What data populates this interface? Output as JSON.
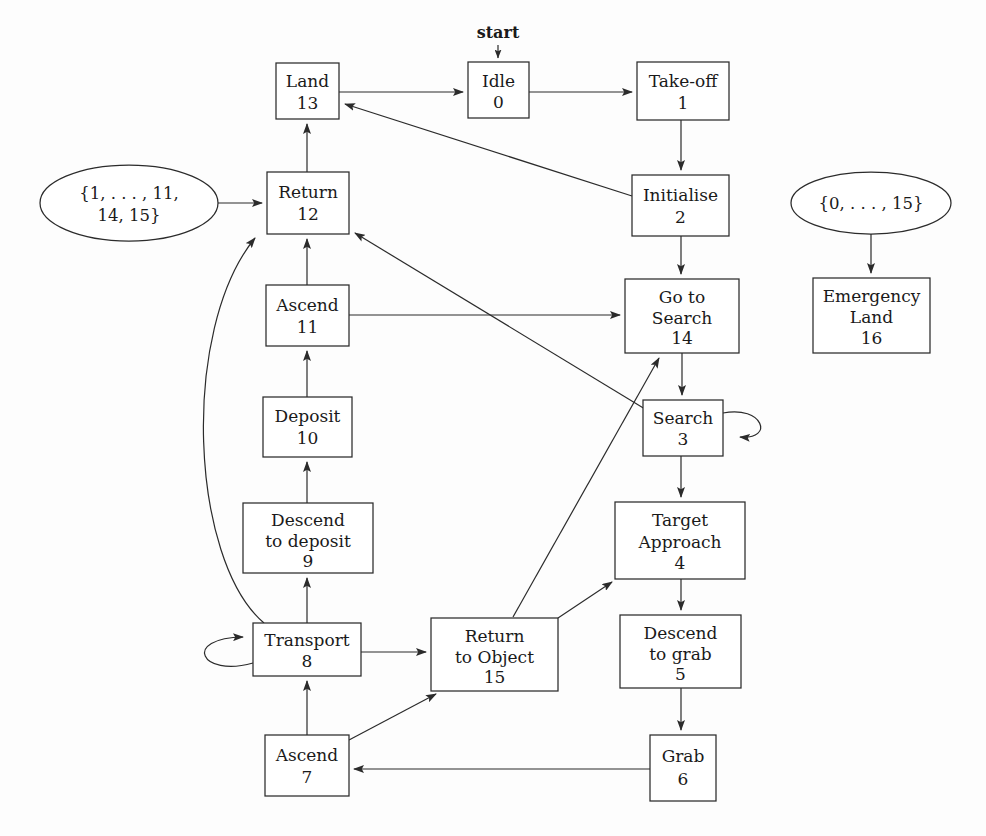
{
  "figure": {
    "type": "state-machine-diagram",
    "title": "",
    "caption": "",
    "start_marker_label": "start",
    "background_color": "#fdfdfd",
    "line_color": "#2b2b2b",
    "text_color": "#1a1a1a"
  },
  "states": [
    {
      "key": "idle",
      "label": "Idle",
      "line1": "Idle",
      "line2": "",
      "id": "0",
      "shape": "rect",
      "x": 468,
      "y": 62,
      "w": 61,
      "h": 56
    },
    {
      "key": "takeoff",
      "label": "Take-off",
      "line1": "Take-off",
      "line2": "",
      "id": "1",
      "shape": "rect",
      "x": 637,
      "y": 62,
      "w": 92,
      "h": 58
    },
    {
      "key": "initialise",
      "label": "Initialise",
      "line1": "Initialise",
      "line2": "",
      "id": "2",
      "shape": "rect",
      "x": 632,
      "y": 175,
      "w": 97,
      "h": 61
    },
    {
      "key": "search",
      "label": "Search",
      "line1": "Search",
      "line2": "",
      "id": "3",
      "shape": "rect",
      "x": 643,
      "y": 400,
      "w": 80,
      "h": 56
    },
    {
      "key": "target_approach",
      "label": "Target Approach",
      "line1": "Target",
      "line2": "Approach",
      "id": "4",
      "shape": "rect",
      "x": 615,
      "y": 502,
      "w": 130,
      "h": 77
    },
    {
      "key": "descend_grab",
      "label": "Descend to grab",
      "line1": "Descend",
      "line2": "to grab",
      "id": "5",
      "shape": "rect",
      "x": 620,
      "y": 615,
      "w": 121,
      "h": 73
    },
    {
      "key": "grab",
      "label": "Grab",
      "line1": "Grab",
      "line2": "",
      "id": "6",
      "shape": "rect",
      "x": 650,
      "y": 735,
      "w": 66,
      "h": 66
    },
    {
      "key": "ascend7",
      "label": "Ascend",
      "line1": "Ascend",
      "line2": "",
      "id": "7",
      "shape": "rect",
      "x": 265,
      "y": 735,
      "w": 84,
      "h": 61
    },
    {
      "key": "transport",
      "label": "Transport",
      "line1": "Transport",
      "line2": "",
      "id": "8",
      "shape": "rect",
      "x": 253,
      "y": 623,
      "w": 108,
      "h": 53
    },
    {
      "key": "descend_deposit",
      "label": "Descend to deposit",
      "line1": "Descend",
      "line2": "to deposit",
      "id": "9",
      "shape": "rect",
      "x": 243,
      "y": 503,
      "w": 130,
      "h": 70
    },
    {
      "key": "deposit",
      "label": "Deposit",
      "line1": "Deposit",
      "line2": "",
      "id": "10",
      "shape": "rect",
      "x": 263,
      "y": 397,
      "w": 89,
      "h": 60
    },
    {
      "key": "ascend11",
      "label": "Ascend",
      "line1": "Ascend",
      "line2": "",
      "id": "11",
      "shape": "rect",
      "x": 266,
      "y": 285,
      "w": 83,
      "h": 61
    },
    {
      "key": "return12",
      "label": "Return",
      "line1": "Return",
      "line2": "",
      "id": "12",
      "shape": "rect",
      "x": 267,
      "y": 172,
      "w": 82,
      "h": 62
    },
    {
      "key": "land",
      "label": "Land",
      "line1": "Land",
      "line2": "",
      "id": "13",
      "shape": "rect",
      "x": 276,
      "y": 63,
      "w": 63,
      "h": 56
    },
    {
      "key": "go_to_search",
      "label": "Go to Search",
      "line1": "Go to",
      "line2": "Search",
      "id": "14",
      "shape": "rect",
      "x": 625,
      "y": 279,
      "w": 114,
      "h": 74
    },
    {
      "key": "return_object",
      "label": "Return to Object",
      "line1": "Return",
      "line2": "to Object",
      "id": "15",
      "shape": "rect",
      "x": 431,
      "y": 618,
      "w": 127,
      "h": 73
    },
    {
      "key": "emergency_land",
      "label": "Emergency Land",
      "line1": "Emergency",
      "line2": "Land",
      "id": "16",
      "shape": "rect",
      "x": 813,
      "y": 278,
      "w": 117,
      "h": 75
    }
  ],
  "set_nodes": [
    {
      "key": "set_left",
      "line1": "{1, . . . , 11,",
      "line2": "14, 15}",
      "cx": 129,
      "cy": 203,
      "rx": 89,
      "ry": 38,
      "target": "return12"
    },
    {
      "key": "set_right",
      "line1": "{0, . . . , 15}",
      "line2": "",
      "cx": 871,
      "cy": 203,
      "rx": 80,
      "ry": 31,
      "target": "emergency_land"
    }
  ],
  "transitions": [
    {
      "from": "start",
      "to": "idle",
      "kind": "start-marker"
    },
    {
      "from": "land",
      "to": "idle",
      "kind": "straight"
    },
    {
      "from": "idle",
      "to": "takeoff",
      "kind": "straight"
    },
    {
      "from": "takeoff",
      "to": "initialise",
      "kind": "straight"
    },
    {
      "from": "initialise",
      "to": "land",
      "kind": "diagonal"
    },
    {
      "from": "initialise",
      "to": "go_to_search",
      "kind": "straight"
    },
    {
      "from": "go_to_search",
      "to": "search",
      "kind": "straight"
    },
    {
      "from": "search",
      "to": "search",
      "kind": "self-loop"
    },
    {
      "from": "search",
      "to": "target_approach",
      "kind": "straight"
    },
    {
      "from": "target_approach",
      "to": "descend_grab",
      "kind": "straight"
    },
    {
      "from": "descend_grab",
      "to": "grab",
      "kind": "straight"
    },
    {
      "from": "grab",
      "to": "ascend7",
      "kind": "straight"
    },
    {
      "from": "ascend7",
      "to": "transport",
      "kind": "straight"
    },
    {
      "from": "ascend7",
      "to": "return_object",
      "kind": "diagonal"
    },
    {
      "from": "transport",
      "to": "transport",
      "kind": "self-loop"
    },
    {
      "from": "transport",
      "to": "return_object",
      "kind": "straight"
    },
    {
      "from": "transport",
      "to": "descend_deposit",
      "kind": "straight"
    },
    {
      "from": "transport",
      "to": "return12",
      "kind": "curve"
    },
    {
      "from": "return_object",
      "to": "target_approach",
      "kind": "diagonal"
    },
    {
      "from": "return_object",
      "to": "go_to_search",
      "kind": "diagonal"
    },
    {
      "from": "descend_deposit",
      "to": "deposit",
      "kind": "straight"
    },
    {
      "from": "deposit",
      "to": "ascend11",
      "kind": "straight"
    },
    {
      "from": "ascend11",
      "to": "return12",
      "kind": "straight"
    },
    {
      "from": "ascend11",
      "to": "go_to_search",
      "kind": "straight"
    },
    {
      "from": "search",
      "to": "return12",
      "kind": "diagonal"
    },
    {
      "from": "return12",
      "to": "land",
      "kind": "straight"
    },
    {
      "from": "set_left",
      "to": "return12",
      "kind": "straight"
    },
    {
      "from": "set_right",
      "to": "emergency_land",
      "kind": "straight"
    }
  ]
}
